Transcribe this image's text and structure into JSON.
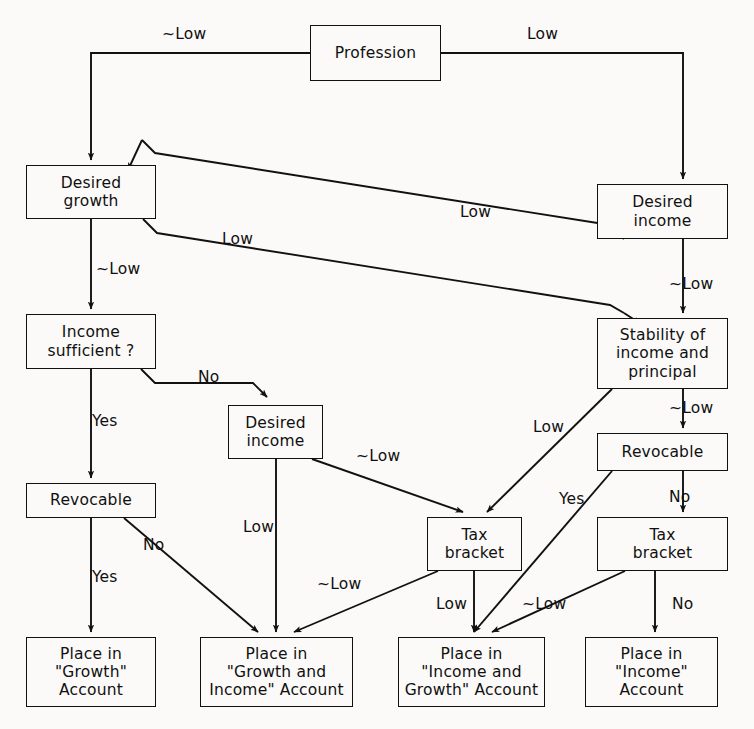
{
  "diagram": {
    "stroke_color": "#111111",
    "background_color": "#fbfaf8",
    "nodes": [
      {
        "id": "profession",
        "label": "Profession",
        "x": 310,
        "y": 25,
        "w": 131,
        "h": 56
      },
      {
        "id": "desired-growth",
        "label": "Desired\ngrowth",
        "x": 26,
        "y": 165,
        "w": 130,
        "h": 54
      },
      {
        "id": "desired-income-r",
        "label": "Desired\nincome",
        "x": 597,
        "y": 184,
        "w": 131,
        "h": 55
      },
      {
        "id": "income-sufficient",
        "label": "Income\nsufficient ?",
        "x": 26,
        "y": 314,
        "w": 130,
        "h": 55
      },
      {
        "id": "stability",
        "label": "Stability of\nincome and\nprincipal",
        "x": 597,
        "y": 318,
        "w": 131,
        "h": 71
      },
      {
        "id": "desired-income-m",
        "label": "Desired\nincome",
        "x": 228,
        "y": 405,
        "w": 95,
        "h": 54
      },
      {
        "id": "revocable-r",
        "label": "Revocable",
        "x": 597,
        "y": 433,
        "w": 131,
        "h": 38
      },
      {
        "id": "revocable-l",
        "label": "Revocable",
        "x": 26,
        "y": 483,
        "w": 130,
        "h": 35
      },
      {
        "id": "tax-bracket-m",
        "label": "Tax\nbracket",
        "x": 427,
        "y": 517,
        "w": 95,
        "h": 54
      },
      {
        "id": "tax-bracket-r",
        "label": "Tax\nbracket",
        "x": 597,
        "y": 517,
        "w": 131,
        "h": 54
      },
      {
        "id": "place-growth",
        "label": "Place in\n\"Growth\"\nAccount",
        "x": 26,
        "y": 637,
        "w": 130,
        "h": 70
      },
      {
        "id": "place-growth-income",
        "label": "Place in\n\"Growth and\nIncome\" Account",
        "x": 200,
        "y": 637,
        "w": 153,
        "h": 70
      },
      {
        "id": "place-income-growth",
        "label": "Place in\n\"Income and\nGrowth\" Account",
        "x": 398,
        "y": 637,
        "w": 147,
        "h": 70
      },
      {
        "id": "place-income",
        "label": "Place in\n\"Income\"\nAccount",
        "x": 585,
        "y": 637,
        "w": 133,
        "h": 70
      }
    ],
    "edge_labels": [
      {
        "id": "lbl-prof-left",
        "text": "~Low",
        "x": 162,
        "y": 27
      },
      {
        "id": "lbl-prof-right",
        "text": "Low",
        "x": 527,
        "y": 27
      },
      {
        "id": "lbl-growth-low",
        "text": "Low",
        "x": 460,
        "y": 205
      },
      {
        "id": "lbl-growth-low2",
        "text": "Low",
        "x": 222,
        "y": 232
      },
      {
        "id": "lbl-growth-notlow",
        "text": "~Low",
        "x": 96,
        "y": 262
      },
      {
        "id": "lbl-income-r-notlow",
        "text": "~Low",
        "x": 669,
        "y": 277
      },
      {
        "id": "lbl-suff-no",
        "text": "No",
        "x": 198,
        "y": 370
      },
      {
        "id": "lbl-suff-yes",
        "text": "Yes",
        "x": 92,
        "y": 414
      },
      {
        "id": "lbl-stab-notlow",
        "text": "~Low",
        "x": 669,
        "y": 401
      },
      {
        "id": "lbl-stab-low",
        "text": "Low",
        "x": 533,
        "y": 420
      },
      {
        "id": "lbl-dim-notlow",
        "text": "~Low",
        "x": 356,
        "y": 449
      },
      {
        "id": "lbl-revr-no",
        "text": "No",
        "x": 669,
        "y": 490
      },
      {
        "id": "lbl-revr-yes",
        "text": "Yes",
        "x": 559,
        "y": 492
      },
      {
        "id": "lbl-dim-low",
        "text": "Low",
        "x": 243,
        "y": 520
      },
      {
        "id": "lbl-revl-no",
        "text": "No",
        "x": 143,
        "y": 538
      },
      {
        "id": "lbl-revl-yes",
        "text": "Yes",
        "x": 92,
        "y": 570
      },
      {
        "id": "lbl-taxm-notlow",
        "text": "~Low",
        "x": 317,
        "y": 577
      },
      {
        "id": "lbl-taxm-low",
        "text": "Low",
        "x": 436,
        "y": 597
      },
      {
        "id": "lbl-taxr-notlow",
        "text": "~Low",
        "x": 522,
        "y": 597
      },
      {
        "id": "lbl-taxr-no",
        "text": "No",
        "x": 672,
        "y": 597
      }
    ]
  }
}
